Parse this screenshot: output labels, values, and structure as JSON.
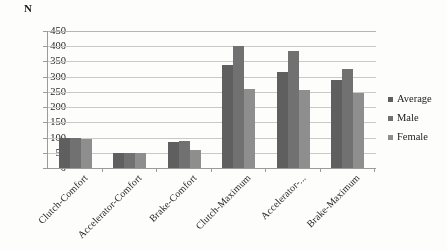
{
  "chart_data": {
    "type": "bar",
    "title": "",
    "xlabel": "",
    "ylabel": "N",
    "ylim": [
      0,
      450
    ],
    "ytick_step": 50,
    "yticks": [
      450,
      400,
      350,
      300,
      250,
      200,
      150,
      100,
      50,
      0
    ],
    "grid": true,
    "legend_position": "right",
    "categories": [
      "Clutch-Comfort",
      "Accelerator-Comfort",
      "Brake-Comfort",
      "Clutch-Maximum",
      "Accelerator-...",
      "Brake-Maximum"
    ],
    "series": [
      {
        "name": "Average",
        "color": "#5d5d5d",
        "values": [
          100,
          50,
          85,
          340,
          315,
          290
        ]
      },
      {
        "name": "Male",
        "color": "#6f6f6f",
        "values": [
          100,
          50,
          90,
          400,
          385,
          325
        ]
      },
      {
        "name": "Female",
        "color": "#8d8d8d",
        "values": [
          95,
          50,
          60,
          260,
          255,
          245
        ]
      }
    ]
  },
  "axis": {
    "unit_label": "N"
  },
  "legend": {
    "items": [
      {
        "label": "Average"
      },
      {
        "label": "Male"
      },
      {
        "label": "Female"
      }
    ]
  }
}
